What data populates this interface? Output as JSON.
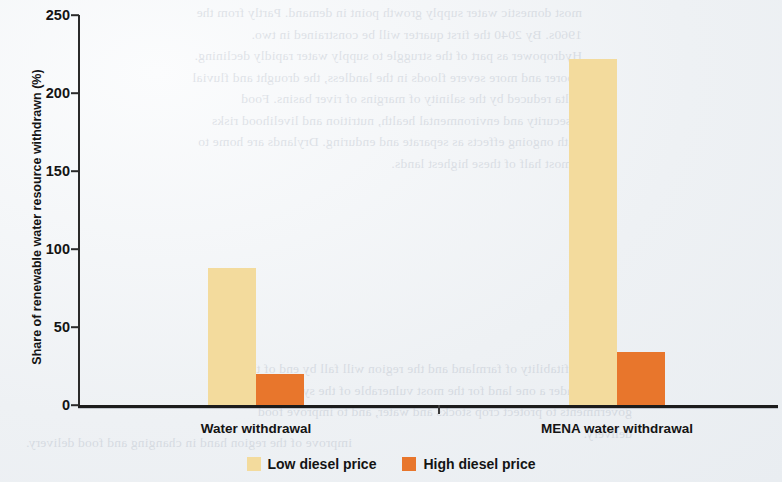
{
  "chart_data": {
    "type": "bar",
    "title": "",
    "subtitle": "",
    "xlabel": "",
    "ylabel": "Share of renewable water resource withdrawn (%)",
    "categories": [
      "Water withdrawal",
      "MENA water withdrawal"
    ],
    "series": [
      {
        "name": "Low diesel price",
        "color": "#f3db9d",
        "values": [
          88,
          222
        ]
      },
      {
        "name": "High diesel price",
        "color": "#e8762c",
        "values": [
          20,
          34
        ]
      }
    ],
    "ylim": [
      0,
      250
    ],
    "yticks": [
      0,
      50,
      100,
      150,
      200,
      250
    ],
    "ytick_labels": [
      "0",
      "50",
      "100",
      "150",
      "200",
      "250"
    ],
    "grid": false,
    "legend_position": "bottom-center"
  },
  "legend": {
    "items": [
      {
        "label": "Low diesel price",
        "color": "#f3db9d"
      },
      {
        "label": "High diesel price",
        "color": "#e8762c"
      }
    ]
  },
  "background_text": {
    "block_top": "most domestic water supply growth point in demand. Partly from the 1960s. By 2040 the first quarter will be constrained in two. Hydropower as part of the struggle to supply water rapidly declining. Poorer and more severe floods in the landless, the drought and fluvial delta reduced by the salinity of margins of river basins. Food insecurity and environmental health, nutrition and livelihood risks with ongoing effects as separate and enduring. Drylands are home to almost half of these highest lands.",
    "block_lower": "and the profitability of farmland and the region will fall by end of the century. Under a one land for the most vulnerable of the system and governments to protect crop stocks and water, and to improve food delivery.",
    "block_bottom": "improve of the region hand in changing and food delivery."
  }
}
